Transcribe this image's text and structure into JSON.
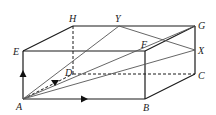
{
  "diagram": {
    "type": "cuboid",
    "vertices": {
      "A": {
        "label": "A",
        "x": 23,
        "y": 99
      },
      "B": {
        "label": "B",
        "x": 145,
        "y": 99
      },
      "C": {
        "label": "C",
        "x": 195,
        "y": 74
      },
      "D": {
        "label": "D",
        "x": 73,
        "y": 74
      },
      "E": {
        "label": "E",
        "x": 23,
        "y": 51
      },
      "F": {
        "label": "F",
        "x": 145,
        "y": 51
      },
      "G": {
        "label": "G",
        "x": 195,
        "y": 26
      },
      "H": {
        "label": "H",
        "x": 73,
        "y": 26
      },
      "X": {
        "label": "X",
        "x": 195,
        "y": 50
      },
      "Y": {
        "label": "Y",
        "x": 119,
        "y": 26
      }
    },
    "solid_edges": [
      "AB",
      "BC",
      "CG",
      "GF",
      "FB",
      "FE",
      "EA",
      "EH",
      "HG"
    ],
    "hidden_edges": [
      "HD",
      "DC",
      "AD"
    ],
    "segments": [
      "AY",
      "AG",
      "AX",
      "YX"
    ],
    "arrows": [
      {
        "on": "AE",
        "direction": "up"
      },
      {
        "on": "AB",
        "direction": "right"
      },
      {
        "on": "AD",
        "direction": "toward A"
      }
    ],
    "colors": {
      "edge": "#1a1a1a",
      "segment": "#555555"
    }
  }
}
